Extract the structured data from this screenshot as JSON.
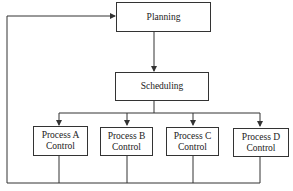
{
  "diagram": {
    "nodes": {
      "planning": "Planning",
      "scheduling": "Scheduling",
      "process_a": {
        "line1": "Process A",
        "line2": "Control"
      },
      "process_b": {
        "line1": "Process B",
        "line2": "Control"
      },
      "process_c": {
        "line1": "Process C",
        "line2": "Control"
      },
      "process_d": {
        "line1": "Process D",
        "line2": "Control"
      }
    },
    "edges": [
      {
        "from": "planning",
        "to": "scheduling"
      },
      {
        "from": "scheduling",
        "to": "process_a"
      },
      {
        "from": "scheduling",
        "to": "process_b"
      },
      {
        "from": "scheduling",
        "to": "process_c"
      },
      {
        "from": "scheduling",
        "to": "process_d"
      },
      {
        "from": "process_a",
        "to": "planning",
        "type": "feedback"
      },
      {
        "from": "process_b",
        "to": "planning",
        "type": "feedback"
      },
      {
        "from": "process_c",
        "to": "planning",
        "type": "feedback"
      },
      {
        "from": "process_d",
        "to": "planning",
        "type": "feedback"
      }
    ],
    "line_color": "#333333"
  }
}
